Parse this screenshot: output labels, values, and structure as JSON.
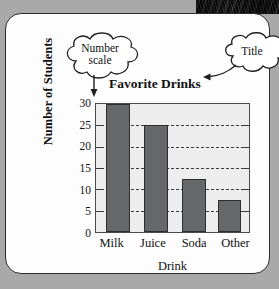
{
  "page": {
    "background_color": "#a9a9a9",
    "card_color": "#fdfdfd"
  },
  "callouts": [
    {
      "id": "number-scale",
      "line1": "Number",
      "line2": "scale"
    },
    {
      "id": "title",
      "line1": "Title",
      "line2": ""
    }
  ],
  "chart_data": {
    "type": "bar",
    "title": "Favorite Drinks",
    "xlabel": "Drink",
    "ylabel": "Number of Students",
    "categories": [
      "Milk",
      "Juice",
      "Soda",
      "Other"
    ],
    "values": [
      30,
      25,
      12.5,
      7.5
    ],
    "ylim": [
      0,
      30
    ],
    "yticks": [
      0,
      5,
      10,
      15,
      20,
      25,
      30
    ],
    "ytick_labels": [
      "0",
      "5",
      "10",
      "15",
      "20",
      "25",
      "30"
    ],
    "grid": true,
    "grid_style": "dashed-horizontal",
    "legend": "none",
    "bar_color": "#666769",
    "plot_background": "#ededed",
    "axis_color": "#4a4a4a"
  }
}
